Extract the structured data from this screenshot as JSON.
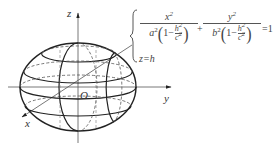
{
  "diagram": {
    "axes": {
      "z_label": "z",
      "y_label": "y",
      "x_label": "x",
      "origin_label": "O"
    },
    "equation": {
      "term1_num": "x",
      "term1_num_exp": "2",
      "term1_den_coef": "a",
      "term1_den_coef_exp": "2",
      "term2_num": "y",
      "term2_num_exp": "2",
      "term2_den_coef": "b",
      "term2_den_coef_exp": "2",
      "one": "1",
      "minus": "−",
      "inner_num": "h",
      "inner_num_exp": "2",
      "inner_den": "c",
      "inner_den_exp": "2",
      "plus": "+",
      "equals_rhs": "=1",
      "second_line": "z=h"
    },
    "colors": {
      "stroke": "#222222",
      "dashed": "#555555",
      "text": "#333333"
    }
  }
}
